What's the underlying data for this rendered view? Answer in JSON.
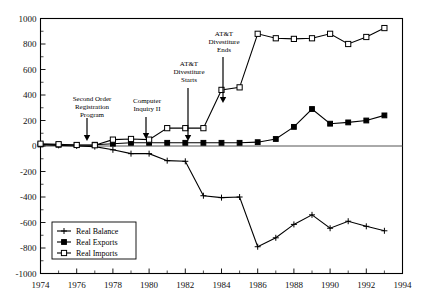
{
  "chart_data": {
    "type": "line",
    "title": "",
    "xlabel": "",
    "ylabel": "",
    "xlim": [
      1974,
      1994
    ],
    "ylim": [
      -1000,
      1000
    ],
    "grid": false,
    "legend_position": "lower-left",
    "x": [
      1974,
      1975,
      1976,
      1977,
      1978,
      1979,
      1980,
      1981,
      1982,
      1983,
      1984,
      1985,
      1986,
      1987,
      1988,
      1989,
      1990,
      1991,
      1992,
      1993
    ],
    "xticks": [
      1974,
      1976,
      1978,
      1980,
      1982,
      1984,
      1986,
      1988,
      1990,
      1992,
      1994
    ],
    "xticklabels": [
      "1974",
      "1976",
      "1978",
      "1980",
      "1982",
      "1984",
      "1986",
      "1988",
      "1990",
      "1992",
      "1994"
    ],
    "xminorticks": [
      1975,
      1977,
      1979,
      1981,
      1983,
      1985,
      1987,
      1989,
      1991,
      1993
    ],
    "yticks": [
      -1000,
      -800,
      -600,
      -400,
      -200,
      0,
      200,
      400,
      600,
      800,
      1000
    ],
    "yticklabels": [
      "-1000",
      "-800",
      "-600",
      "-400",
      "-200",
      "0",
      "200",
      "400",
      "600",
      "800",
      "1000"
    ],
    "series": [
      {
        "name": "Real Balance",
        "marker": "plus",
        "values": [
          10,
          5,
          0,
          -5,
          -30,
          -60,
          -60,
          -115,
          -120,
          -390,
          -405,
          -400,
          -790,
          -720,
          -615,
          -540,
          -645,
          -590,
          -630,
          -665
        ]
      },
      {
        "name": "Real Exports",
        "marker": "filled-square",
        "values": [
          12,
          10,
          8,
          10,
          18,
          25,
          25,
          25,
          25,
          25,
          25,
          25,
          30,
          55,
          150,
          290,
          175,
          185,
          200,
          240
        ]
      },
      {
        "name": "Real Imports",
        "marker": "open-square",
        "values": [
          18,
          14,
          8,
          6,
          50,
          55,
          50,
          140,
          140,
          140,
          440,
          460,
          880,
          845,
          840,
          845,
          880,
          800,
          855,
          925
        ]
      }
    ],
    "annotations": [
      {
        "label": "Second Order\nRegistration\nProgram",
        "lines": [
          "Second Order",
          "Registration",
          "Program"
        ],
        "x": 1977,
        "points_to_year": 1977
      },
      {
        "label": "Computer\nInquiry II",
        "lines": [
          "Computer",
          "Inquiry II"
        ],
        "x": 1980,
        "points_to_year": 1980
      },
      {
        "label": "AT&T\nDivestiture\nStarts",
        "lines": [
          "AT&T",
          "Divestiture",
          "Starts"
        ],
        "x": 1982,
        "points_to_year": 1982
      },
      {
        "label": "AT&T\nDivestiture\nEnds",
        "lines": [
          "AT&T",
          "Divestiture",
          "Ends"
        ],
        "x": 1984,
        "points_to_year": 1984
      }
    ]
  },
  "legend": {
    "items": [
      {
        "label": "Real Balance",
        "marker": "plus"
      },
      {
        "label": "Real Exports",
        "marker": "filled-square"
      },
      {
        "label": "Real Imports",
        "marker": "open-square"
      }
    ]
  },
  "colors": {
    "line": "#000000",
    "frame": "#000000",
    "background": "#ffffff",
    "zero_line": "#555555"
  }
}
